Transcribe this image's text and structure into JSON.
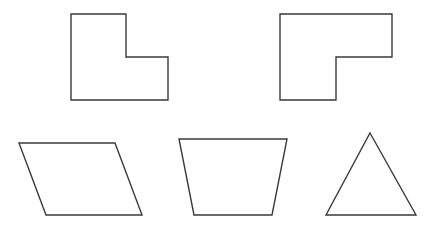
{
  "canvas": {
    "width": 435,
    "height": 227,
    "background": "#ffffff",
    "stroke_color": "#3a3a3a"
  },
  "shapes": [
    {
      "name": "l-shape-1",
      "kind": "L-shaped hexagon",
      "points": "71,14 126,14 126,57 168,57 168,100 71,100"
    },
    {
      "name": "l-shape-2",
      "kind": "L-shaped hexagon",
      "points": "280,14 392,14 392,57 336,57 336,100 280,100"
    },
    {
      "name": "parallelogram",
      "kind": "parallelogram",
      "points": "19,143 115,143 142,215 46,215"
    },
    {
      "name": "trapezoid",
      "kind": "trapezoid",
      "points": "179,139 287,139 272,215 194,215"
    },
    {
      "name": "triangle",
      "kind": "triangle",
      "points": "370,133 416,215 326,215"
    }
  ]
}
